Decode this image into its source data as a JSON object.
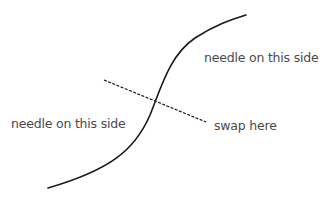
{
  "diagram": {
    "labels": {
      "upper_right": "needle on this side",
      "lower_left": "needle on this side",
      "swap": "swap here"
    },
    "colors": {
      "stroke": "#1a1a1a",
      "text": "#4a4a4a",
      "background": "#ffffff"
    },
    "curve": {
      "description": "S-shaped curve from lower-left to upper-right",
      "start": [
        48,
        188
      ],
      "end": [
        246,
        15
      ]
    },
    "dashed_line": {
      "start": [
        104,
        80
      ],
      "end": [
        206,
        122
      ]
    }
  }
}
